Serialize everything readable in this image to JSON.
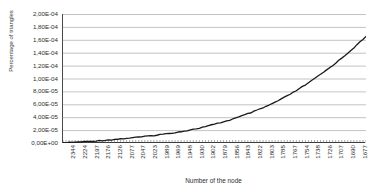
{
  "chart_data": {
    "type": "line",
    "title": "",
    "xlabel": "Number of the node",
    "ylabel": "Percentage of triangles",
    "ylim": [
      0,
      0.0002
    ],
    "grid": true,
    "legend": null,
    "y_tick_labels": [
      "2,00E-04",
      "1,80E-04",
      "1,60E-04",
      "1,40E-04",
      "1,20E-04",
      "1,00E-04",
      "8,00E-05",
      "6,00E-05",
      "4,00E-05",
      "2,00E-05",
      "0,00E+00"
    ],
    "y_tick_values": [
      0.0002,
      0.00018,
      0.00016,
      0.00014,
      0.00012,
      0.0001,
      8e-05,
      6e-05,
      4e-05,
      2e-05,
      0
    ],
    "x_tick_labels": [
      "2344",
      "2224",
      "2197",
      "2176",
      "2126",
      "2077",
      "2047",
      "2023",
      "1989",
      "1969",
      "1948",
      "1930",
      "1902",
      "1879",
      "1856",
      "1843",
      "1822",
      "1803",
      "1785",
      "1767",
      "1754",
      "1738",
      "1726",
      "1707",
      "1690",
      "1677"
    ],
    "series": [
      {
        "name": "Percentage of triangles",
        "color": "#1a1a1a",
        "x": [
          0,
          1,
          2,
          3,
          4,
          5,
          6,
          7,
          8,
          9,
          10,
          11,
          12,
          13,
          14,
          15,
          16,
          17,
          18,
          19,
          20,
          21,
          22,
          23,
          24,
          25,
          26,
          27,
          28,
          29,
          30,
          31,
          32,
          33,
          34,
          35,
          36,
          37,
          38,
          39,
          40,
          41,
          42,
          43,
          44,
          45,
          46,
          47,
          48,
          49,
          50,
          51,
          52,
          53,
          54,
          55,
          56,
          57,
          58,
          59,
          60,
          61,
          62,
          63,
          64,
          65,
          66,
          67,
          68,
          69,
          70,
          71,
          72,
          73,
          74,
          75,
          76,
          77,
          78,
          79,
          80,
          81,
          82,
          83,
          84,
          85,
          86,
          87,
          88,
          89,
          90,
          91,
          92,
          93,
          94,
          95,
          96,
          97,
          98,
          99,
          100
        ],
        "values": [
          0.0,
          4e-07,
          8e-07,
          1.2e-06,
          1.6e-06,
          2e-06,
          2.4e-06,
          2.8e-06,
          3.2e-06,
          3.6e-06,
          4.1e-06,
          4.5e-06,
          5e-06,
          5.5e-06,
          6e-06,
          6.5e-06,
          7e-06,
          7.5e-06,
          8.1e-06,
          8.6e-06,
          9.2e-06,
          9.8e-06,
          1.04e-05,
          1.1e-05,
          1.16e-05,
          1.23e-05,
          1.3e-05,
          1.37e-05,
          1.44e-05,
          1.51e-05,
          1.59e-05,
          1.67e-05,
          1.75e-05,
          1.83e-05,
          1.92e-05,
          2.01e-05,
          2.1e-05,
          2.2e-05,
          2.3e-05,
          2.41e-05,
          2.52e-05,
          2.63e-05,
          2.75e-05,
          2.88e-05,
          3.01e-05,
          3.15e-05,
          3.29e-05,
          3.44e-05,
          3.6e-05,
          3.76e-05,
          3.93e-05,
          4.1e-05,
          4.28e-05,
          4.46e-05,
          4.65e-05,
          4.84e-05,
          5.04e-05,
          5.24e-05,
          5.45e-05,
          5.67e-05,
          5.89e-05,
          6.12e-05,
          6.36e-05,
          6.6e-05,
          6.85e-05,
          7.11e-05,
          7.38e-05,
          7.66e-05,
          7.95e-05,
          8.25e-05,
          8.56e-05,
          8.88e-05,
          9.21e-05,
          9.55e-05,
          9.9e-05,
          0.0001026,
          0.0001063,
          0.0001101,
          0.000114,
          0.000118,
          0.0001221,
          0.0001263,
          0.0001306,
          0.000135,
          0.0001395,
          0.000144,
          0.0001486,
          0.0001533,
          0.0001581,
          0.000163,
          0.000168,
          0.0001731,
          0.0001783,
          0.0001836,
          0.000189,
          0.0001945,
          0.0002001,
          0.0002058,
          0.0002116,
          0.0002175,
          0.0002235
        ]
      }
    ]
  }
}
